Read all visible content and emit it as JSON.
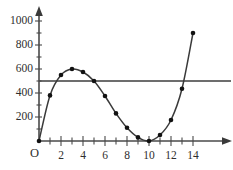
{
  "chart_data": {
    "type": "line",
    "title": "",
    "subtitle": "",
    "xlabel": "",
    "ylabel": "",
    "xlim": [
      0,
      14.6
    ],
    "ylim": [
      0,
      1060
    ],
    "grid": false,
    "legend": null,
    "origin_label": "O",
    "x_ticks_major": [
      2,
      4,
      6,
      8,
      10,
      12,
      14
    ],
    "x_ticks_minor": [
      1,
      3,
      5,
      7,
      9,
      11,
      13
    ],
    "x_tick_labels": [
      "2",
      "4",
      "6",
      "8",
      "10",
      "12",
      "14"
    ],
    "y_ticks_major": [
      200,
      400,
      600,
      800,
      1000
    ],
    "y_ticks_minor": [
      100,
      300,
      500,
      700,
      900
    ],
    "y_tick_labels": [
      "200",
      "400",
      "600",
      "800",
      "1000"
    ],
    "series": [
      {
        "name": "curve",
        "style": "smooth-curve-with-markers",
        "x": [
          0,
          1,
          2,
          3,
          4,
          5,
          6,
          7,
          8,
          9,
          10,
          11,
          12,
          13,
          14
        ],
        "values": [
          0,
          380,
          550,
          600,
          575,
          500,
          375,
          230,
          110,
          30,
          0,
          50,
          175,
          435,
          900
        ]
      },
      {
        "name": "reference-line",
        "style": "horizontal-line",
        "value": 500,
        "x": [
          0,
          14.6
        ],
        "values": [
          500,
          500
        ]
      }
    ],
    "annotations": []
  }
}
